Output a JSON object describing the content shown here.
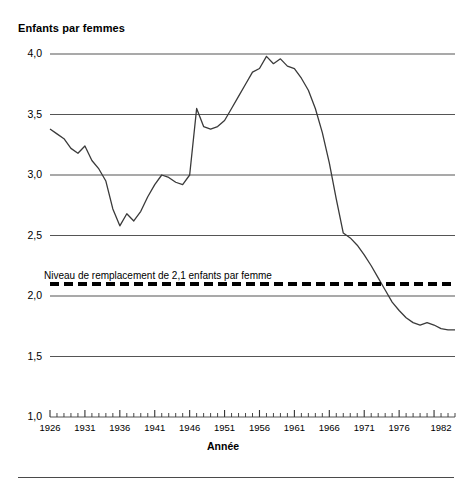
{
  "chart_data": {
    "type": "line",
    "title": "",
    "ylabel": "Enfants par femmes",
    "xlabel": "Année",
    "ylim": [
      1.0,
      4.0
    ],
    "xlim": [
      1926,
      1984
    ],
    "grid": true,
    "legend": false,
    "y_ticks": [
      "1,0",
      "1,5",
      "2,0",
      "2,5",
      "3,0",
      "3,5",
      "4,0"
    ],
    "y_tick_values": [
      1.0,
      1.5,
      2.0,
      2.5,
      3.0,
      3.5,
      4.0
    ],
    "x_ticks": [
      "1926",
      "1931",
      "1936",
      "1941",
      "1946",
      "1951",
      "1956",
      "1961",
      "1966",
      "1971",
      "1976",
      "1982"
    ],
    "x_tick_values": [
      1926,
      1931,
      1936,
      1941,
      1946,
      1951,
      1956,
      1961,
      1966,
      1971,
      1976,
      1982
    ],
    "annotations": [
      {
        "name": "replacement-level",
        "text": "Niveau de remplacement de 2,1 enfants par femme",
        "value": 2.1,
        "style": "dashed",
        "color": "#000000"
      }
    ],
    "series": [
      {
        "name": "Indice synthétique de fécondité",
        "color": "#3a3a3a",
        "x": [
          1926,
          1927,
          1928,
          1929,
          1930,
          1931,
          1932,
          1933,
          1934,
          1935,
          1936,
          1937,
          1938,
          1939,
          1940,
          1941,
          1942,
          1943,
          1944,
          1945,
          1946,
          1947,
          1948,
          1949,
          1950,
          1951,
          1952,
          1953,
          1954,
          1955,
          1956,
          1957,
          1958,
          1959,
          1960,
          1961,
          1962,
          1963,
          1964,
          1965,
          1966,
          1967,
          1968,
          1969,
          1970,
          1971,
          1972,
          1973,
          1974,
          1975,
          1976,
          1977,
          1978,
          1979,
          1980,
          1981,
          1982,
          1983,
          1984
        ],
        "y": [
          3.38,
          3.34,
          3.3,
          3.22,
          3.18,
          3.24,
          3.12,
          3.05,
          2.95,
          2.72,
          2.58,
          2.68,
          2.62,
          2.7,
          2.82,
          2.92,
          3.0,
          2.98,
          2.94,
          2.92,
          3.0,
          3.55,
          3.4,
          3.38,
          3.4,
          3.45,
          3.55,
          3.65,
          3.75,
          3.85,
          3.88,
          3.98,
          3.92,
          3.96,
          3.9,
          3.88,
          3.8,
          3.7,
          3.55,
          3.35,
          3.1,
          2.8,
          2.52,
          2.48,
          2.42,
          2.34,
          2.25,
          2.15,
          2.05,
          1.95,
          1.88,
          1.82,
          1.78,
          1.76,
          1.78,
          1.76,
          1.73,
          1.72,
          1.72
        ]
      }
    ]
  },
  "figure": {
    "y_axis_title": "Enfants par femmes",
    "x_axis_title": "Année",
    "replacement_label": "Niveau de remplacement de 2,1 enfants par femme"
  }
}
